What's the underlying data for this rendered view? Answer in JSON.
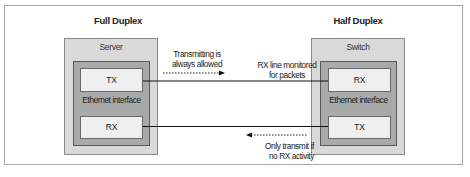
{
  "diagram": {
    "left": {
      "title": "Full Duplex",
      "device": "Server",
      "interface": "Ethernet interface",
      "top_port": "TX",
      "bottom_port": "RX"
    },
    "right": {
      "title": "Half Duplex",
      "device": "Switch",
      "interface": "Ethernet interface",
      "top_port": "RX",
      "bottom_port": "TX"
    },
    "annotations": {
      "tx_note_line1": "Transmitting is",
      "tx_note_line2": "always allowed",
      "rx_note_line1": "RX line monitored",
      "rx_note_line2": "for packets",
      "half_tx_note_line1": "Only transmit if",
      "half_tx_note_line2": "no RX activity"
    },
    "colors": {
      "frame_border": "#a8a8a8",
      "device_fill": "#d9d9d9",
      "interface_fill": "#a9a9a9",
      "port_fill": "#efefef",
      "line": "#111111"
    }
  }
}
